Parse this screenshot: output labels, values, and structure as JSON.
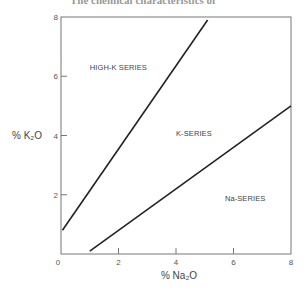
{
  "header": {
    "partial_title": "The chemical characteristics of"
  },
  "chart_data": {
    "type": "line",
    "title": "",
    "xlabel": "% Na₂O",
    "ylabel": "% K₂O",
    "xlim": [
      0,
      8
    ],
    "ylim": [
      0,
      8
    ],
    "x_ticks": [
      "0",
      "2",
      "4",
      "6",
      "8"
    ],
    "y_ticks": [
      "2",
      "4",
      "6",
      "8"
    ],
    "grid": false,
    "series": [
      {
        "name": "High-K / K boundary",
        "points": [
          [
            0.05,
            0.8
          ],
          [
            5.1,
            7.9
          ]
        ]
      },
      {
        "name": "K / Na boundary",
        "points": [
          [
            1.0,
            0.1
          ],
          [
            8.0,
            5.0
          ]
        ]
      }
    ],
    "annotations": [
      {
        "text": "HIGH-K SERIES",
        "x": 1.0,
        "y": 6.2
      },
      {
        "text": "K-SERIES",
        "x": 4.0,
        "y": 4.0
      },
      {
        "text": "Na-SERIES",
        "x": 5.7,
        "y": 1.8
      }
    ],
    "line_color": "#222222"
  }
}
